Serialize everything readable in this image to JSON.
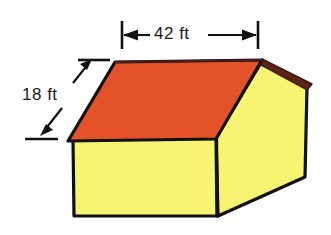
{
  "figure": {
    "shape_name": "house-prism",
    "background_color": "#ffffff"
  },
  "colors": {
    "roof_orange": "#E4522A",
    "roof_edge_brown": "#5A2417",
    "wall_yellow": "#F7F471",
    "outline_black": "#111111",
    "text_black": "#1a1a1a"
  },
  "dimensions": [
    {
      "id": "width",
      "value": "42 ft",
      "number": 42,
      "unit": "ft",
      "orientation": "horizontal",
      "measures": "roof ridge width (top edge of roof)",
      "arrow_style": "double-headed between end ticks"
    },
    {
      "id": "slant",
      "value": "18 ft",
      "number": 18,
      "unit": "ft",
      "orientation": "diagonal",
      "measures": "roof slant height (sloped face)",
      "arrow_style": "two leader arrows to tick marks"
    }
  ],
  "solid": {
    "faces": [
      {
        "name": "roof-slope",
        "color": "#E4522A",
        "description": "large sloped orange roof face"
      },
      {
        "name": "front-wall",
        "color": "#F7F471",
        "description": "front yellow rectangular wall"
      },
      {
        "name": "gable-end-wall",
        "color": "#F7F471",
        "description": "right-side yellow gable end wall"
      },
      {
        "name": "roof-edge",
        "color": "#5A2417",
        "description": "dark brown roof overhang edge on right"
      }
    ]
  }
}
